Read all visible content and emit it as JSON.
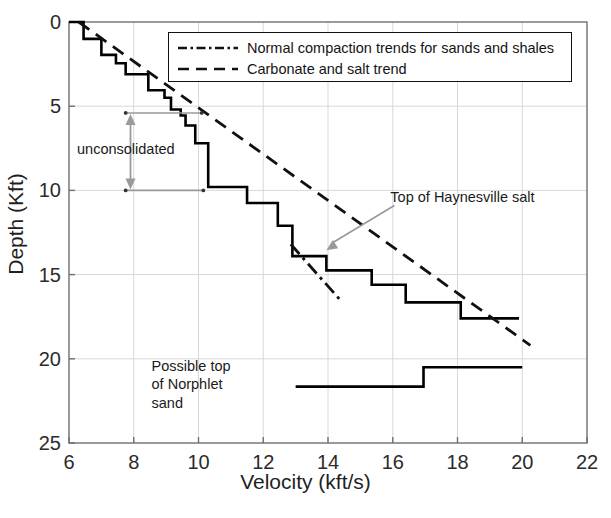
{
  "chart_data": {
    "type": "line",
    "title": "",
    "xlabel": "Velocity (kft/s)",
    "ylabel": "Depth (Kft)",
    "xlim": [
      6,
      22
    ],
    "ylim": [
      25,
      0
    ],
    "y_inverted": true,
    "xticks": [
      6,
      8,
      10,
      12,
      14,
      16,
      18,
      20,
      22
    ],
    "yticks": [
      0,
      5,
      10,
      15,
      20,
      25
    ],
    "grid": true,
    "legend_position": "top-center",
    "series": [
      {
        "name": "velocity-depth-step-profile",
        "style": "solid",
        "color": "#000000",
        "drawstyle": "steps",
        "points": [
          [
            6.0,
            0.0
          ],
          [
            6.45,
            0.0
          ],
          [
            6.45,
            1.0
          ],
          [
            7.0,
            1.0
          ],
          [
            7.0,
            1.95
          ],
          [
            7.45,
            1.95
          ],
          [
            7.45,
            2.45
          ],
          [
            7.75,
            2.45
          ],
          [
            7.75,
            3.1
          ],
          [
            8.45,
            3.1
          ],
          [
            8.45,
            4.05
          ],
          [
            8.95,
            4.05
          ],
          [
            8.95,
            4.5
          ],
          [
            9.15,
            4.5
          ],
          [
            9.15,
            5.2
          ],
          [
            9.45,
            5.2
          ],
          [
            9.45,
            5.55
          ],
          [
            9.6,
            5.55
          ],
          [
            9.6,
            6.15
          ],
          [
            9.9,
            6.15
          ],
          [
            9.9,
            7.2
          ],
          [
            10.3,
            7.2
          ],
          [
            10.3,
            8.6
          ],
          [
            10.3,
            9.8
          ],
          [
            11.5,
            9.8
          ],
          [
            11.5,
            10.75
          ],
          [
            12.45,
            10.75
          ],
          [
            12.45,
            12.1
          ],
          [
            12.9,
            12.1
          ],
          [
            12.9,
            13.9
          ],
          [
            13.95,
            13.9
          ],
          [
            13.95,
            14.75
          ],
          [
            15.35,
            14.75
          ],
          [
            15.35,
            15.6
          ],
          [
            16.4,
            15.6
          ],
          [
            16.4,
            16.65
          ],
          [
            18.1,
            16.65
          ],
          [
            18.1,
            17.6
          ],
          [
            19.9,
            17.6
          ]
        ]
      },
      {
        "name": "normal-compaction-trend",
        "style": "dashdot",
        "color": "#111111",
        "points": [
          [
            12.85,
            13.2
          ],
          [
            14.35,
            16.45
          ]
        ]
      },
      {
        "name": "carbonate-salt-trend",
        "style": "dashed",
        "color": "#111111",
        "points": [
          [
            6.3,
            0.0
          ],
          [
            20.25,
            19.2
          ]
        ]
      },
      {
        "name": "norphlet-sand-step",
        "style": "solid",
        "color": "#000000",
        "drawstyle": "steps",
        "points": [
          [
            13.0,
            21.65
          ],
          [
            16.95,
            21.65
          ],
          [
            16.95,
            20.5
          ],
          [
            20.0,
            20.5
          ]
        ]
      }
    ],
    "annotations": [
      {
        "name": "unconsolidated",
        "text": "unconsolidated",
        "color": "#8d8d8d",
        "x": 7.9,
        "depth_from": 5.4,
        "depth_to": 10.0,
        "marker": "double-headed-vertical-arrow"
      },
      {
        "name": "top-of-haynesville-salt",
        "text": "Top of Haynesville salt",
        "color": "#9a9a9a",
        "arrow_from": [
          16.05,
          10.9
        ],
        "arrow_to": [
          13.95,
          13.55
        ]
      },
      {
        "name": "possible-top-of-norphlet-sand",
        "lines": [
          "Possible top",
          "of Norphlet",
          "sand"
        ],
        "color": "#1a1a1a",
        "x": 9.0,
        "depth": 20.3
      }
    ]
  },
  "axes": {
    "x_title": "Velocity (kft/s)",
    "y_title": "Depth (Kft)",
    "x_ticklabels": [
      "6",
      "8",
      "10",
      "12",
      "14",
      "16",
      "18",
      "20",
      "22"
    ],
    "y_ticklabels": [
      "0",
      "5",
      "10",
      "15",
      "20",
      "25"
    ]
  },
  "legend": {
    "items": [
      {
        "label": "Normal compaction trends for sands and shales",
        "style": "dashdot"
      },
      {
        "label": "Carbonate and salt trend",
        "style": "dashed"
      }
    ]
  },
  "annotation_text": {
    "unconsolidated": "unconsolidated",
    "haynesville": "Top of Haynesville salt",
    "norphlet_line1": "Possible top",
    "norphlet_line2": "of Norphlet",
    "norphlet_line3": "sand"
  },
  "colors": {
    "curve": "#000000",
    "trend": "#111111",
    "annotation_gray": "#9a9a9a",
    "grid": "#d8d8d8",
    "axis": "#6f6f6f",
    "text": "#1a1a1a"
  }
}
